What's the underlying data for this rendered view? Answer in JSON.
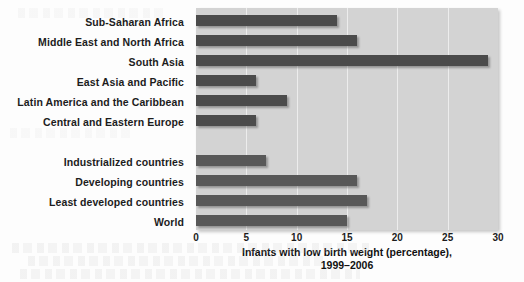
{
  "chart_data": {
    "type": "bar",
    "orientation": "horizontal",
    "title": "",
    "xlabel": "Infants with low birth weight (percentage), 1999–2006",
    "ylabel": "",
    "xlim": [
      0,
      30
    ],
    "xticks": [
      "0",
      "5",
      "10",
      "15",
      "20",
      "25",
      "30"
    ],
    "grid": true,
    "legend": "none",
    "categories": [
      "Sub-Saharan Africa",
      "Middle East and North Africa",
      "South Asia",
      "East Asia and Pacific",
      "Latin America and the Caribbean",
      "Central and Eastern Europe",
      "",
      "Industrialized countries",
      "Developing countries",
      "Least developed countries",
      "World"
    ],
    "values": [
      14,
      16,
      29,
      6,
      9,
      6,
      null,
      7,
      16,
      17,
      15
    ],
    "series": [
      {
        "name": "Infants with low birth weight (percentage)",
        "values": [
          14,
          16,
          29,
          6,
          9,
          6,
          null,
          7,
          16,
          17,
          15
        ]
      }
    ]
  },
  "axis_title": {
    "line1": "Infants with low birth weight (percentage),",
    "line2": "1999–2006"
  },
  "colors": {
    "bar_region": "#4b4b4b",
    "bar_aggregate": "#585858",
    "plot_background": "#d3d3d3",
    "gridline": "#ededed",
    "text": "#1c1c1c",
    "page_background": "#fdfdfd"
  }
}
